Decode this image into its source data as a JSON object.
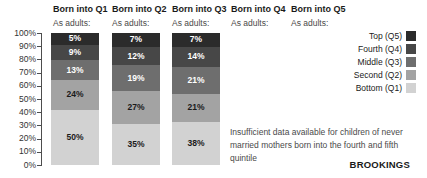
{
  "columns": [
    {
      "label": "Born into Q1",
      "sublabel": "As adults:"
    },
    {
      "label": "Born into Q2",
      "sublabel": "As adults:"
    },
    {
      "label": "Born into Q3",
      "sublabel": "As adults:"
    },
    {
      "label": "Born into Q4",
      "sublabel": "As adults:"
    },
    {
      "label": "Born into Q5",
      "sublabel": "As adults:"
    }
  ],
  "y_axis": {
    "ticks": [
      "100%",
      "90%",
      "80%",
      "70%",
      "60%",
      "50%",
      "40%",
      "30%",
      "20%",
      "10%",
      "0%"
    ]
  },
  "legend": [
    {
      "label": "Top (Q5)",
      "color": "#2b2b2b"
    },
    {
      "label": "Fourth (Q4)",
      "color": "#474747"
    },
    {
      "label": "Middle (Q3)",
      "color": "#6e6e6e"
    },
    {
      "label": "Second (Q2)",
      "color": "#a3a3a3"
    },
    {
      "label": "Bottom (Q1)",
      "color": "#d2d2d2"
    }
  ],
  "note": "Insufficient data available for children of never married mothers born into the fourth and fifth quintile",
  "brand": "BROOKINGS",
  "chart_data": {
    "type": "bar",
    "stacked": true,
    "unit": "%",
    "categories": [
      "Born into Q1",
      "Born into Q2",
      "Born into Q3",
      "Born into Q4",
      "Born into Q5"
    ],
    "series": [
      {
        "name": "Top (Q5)",
        "values": [
          5,
          7,
          7,
          null,
          null
        ]
      },
      {
        "name": "Fourth (Q4)",
        "values": [
          9,
          12,
          14,
          null,
          null
        ]
      },
      {
        "name": "Middle (Q3)",
        "values": [
          13,
          19,
          21,
          null,
          null
        ]
      },
      {
        "name": "Second (Q2)",
        "values": [
          24,
          27,
          21,
          null,
          null
        ]
      },
      {
        "name": "Bottom (Q1)",
        "values": [
          50,
          35,
          38,
          null,
          null
        ]
      }
    ],
    "ylim": [
      0,
      100
    ],
    "y_tick_step": 10,
    "grid": false,
    "legend_position": "right",
    "annotation": "Insufficient data available for children of never married mothers born into the fourth and fifth quintile"
  }
}
